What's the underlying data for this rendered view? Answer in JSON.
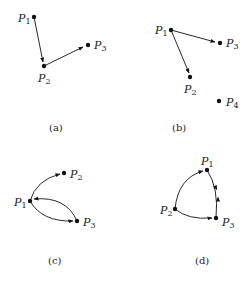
{
  "panels": [
    {
      "id": "a",
      "caption": "(a)",
      "nodes": [
        {
          "name": "P",
          "sub": "1",
          "x": 34,
          "y": 17,
          "lx": 16,
          "ly": 21
        },
        {
          "name": "P",
          "sub": "2",
          "x": 44,
          "y": 66,
          "lx": 38,
          "ly": 82
        },
        {
          "name": "P",
          "sub": "3",
          "x": 88,
          "y": 45,
          "lx": 94,
          "ly": 49
        }
      ],
      "edges": [
        {
          "from": "P1",
          "to": "P2"
        },
        {
          "from": "P2",
          "to": "P3"
        }
      ]
    },
    {
      "id": "b",
      "caption": "(b)",
      "nodes": [
        {
          "name": "P",
          "sub": "1",
          "x": 171,
          "y": 30,
          "lx": 156,
          "ly": 34
        },
        {
          "name": "P",
          "sub": "2",
          "x": 190,
          "y": 77,
          "lx": 184,
          "ly": 93
        },
        {
          "name": "P",
          "sub": "3",
          "x": 220,
          "y": 43,
          "lx": 226,
          "ly": 47
        },
        {
          "name": "P",
          "sub": "4",
          "x": 219,
          "y": 101,
          "lx": 226,
          "ly": 106
        }
      ],
      "edges": [
        {
          "from": "P1",
          "to": "P3"
        },
        {
          "from": "P1",
          "to": "P2"
        }
      ]
    },
    {
      "id": "c",
      "caption": "(c)",
      "nodes": [
        {
          "name": "P",
          "sub": "1",
          "x": 30,
          "y": 201,
          "lx": 14,
          "ly": 206
        },
        {
          "name": "P",
          "sub": "2",
          "x": 64,
          "y": 173,
          "lx": 70,
          "ly": 178
        },
        {
          "name": "P",
          "sub": "3",
          "x": 77,
          "y": 221,
          "lx": 83,
          "ly": 226
        }
      ],
      "edges": [
        {
          "from": "P1",
          "to": "P2",
          "curved": true
        },
        {
          "from": "P1",
          "to": "P3",
          "curved": true
        },
        {
          "from": "P3",
          "to": "P1",
          "curved": true
        }
      ]
    },
    {
      "id": "d",
      "caption": "(d)",
      "nodes": [
        {
          "name": "P",
          "sub": "1",
          "x": 207,
          "y": 170,
          "lx": 201,
          "ly": 164
        },
        {
          "name": "P",
          "sub": "2",
          "x": 175,
          "y": 209,
          "lx": 160,
          "ly": 214
        },
        {
          "name": "P",
          "sub": "3",
          "x": 216,
          "y": 218,
          "lx": 222,
          "ly": 226
        }
      ],
      "edges": [
        {
          "from": "P2",
          "to": "P1",
          "curved": true
        },
        {
          "from": "P1",
          "to": "P3",
          "curved": true
        },
        {
          "from": "P3",
          "to": "P1",
          "curved": true
        },
        {
          "from": "P2",
          "to": "P3",
          "curved": true
        }
      ]
    }
  ]
}
